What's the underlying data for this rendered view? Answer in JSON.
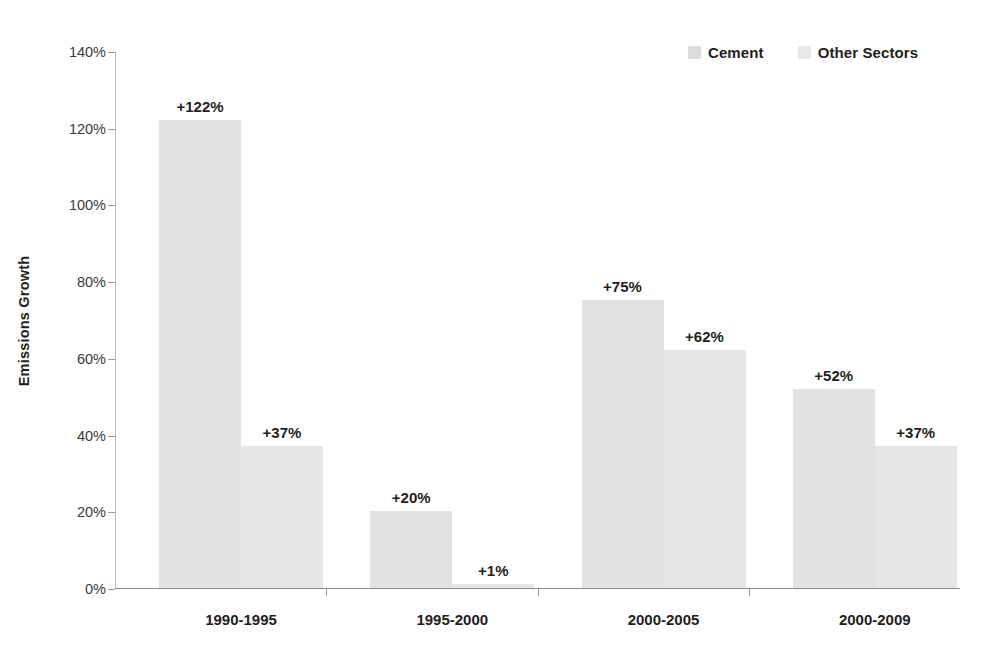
{
  "chart_data": {
    "type": "bar",
    "title": "",
    "xlabel": "",
    "ylabel": "Emissions Growth",
    "ylim": [
      0,
      140
    ],
    "ytick_step": 20,
    "ytick_labels": [
      "0%",
      "20%",
      "40%",
      "60%",
      "80%",
      "100%",
      "120%",
      "140%"
    ],
    "ytick_values": [
      0,
      20,
      40,
      60,
      80,
      100,
      120,
      140
    ],
    "grid": false,
    "legend_position": "top-right",
    "categories": [
      "1990-1995",
      "1995-2000",
      "2000-2005",
      "2000-2009"
    ],
    "series": [
      {
        "name": "Cement",
        "color": "#e2e2e2",
        "values": [
          122,
          20,
          75,
          52
        ],
        "value_labels": [
          "+122%",
          "+20%",
          "+75%",
          "+52%"
        ]
      },
      {
        "name": "Other Sectors",
        "color": "#e6e6e6",
        "values": [
          37,
          1,
          62,
          37
        ],
        "value_labels": [
          "+37%",
          "+1%",
          "+62%",
          "+37%"
        ]
      }
    ]
  },
  "legend": {
    "entries": [
      {
        "label": "Cement",
        "color": "#dcdcdc"
      },
      {
        "label": "Other Sectors",
        "color": "#e8e8e8"
      }
    ]
  },
  "axes": {
    "y_title": "Emissions Growth",
    "axis_color": "#8e8e8e",
    "tick_color": "#9a9a9a",
    "label_color": "#3a3a3a"
  }
}
